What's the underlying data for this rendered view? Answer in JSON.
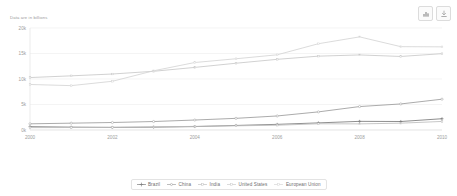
{
  "toolbar": {
    "buttons": [
      {
        "name": "chart-type-icon",
        "label": "Chart settings"
      },
      {
        "name": "download-icon",
        "label": "Download"
      }
    ]
  },
  "chart_data": {
    "type": "line",
    "title": "",
    "subtitle": "Data are in billions",
    "xlabel": "",
    "ylabel": "",
    "grid": true,
    "legend_position": "bottom",
    "x": [
      2000,
      2001,
      2002,
      2003,
      2004,
      2005,
      2006,
      2007,
      2008,
      2009,
      2010
    ],
    "xticks": [
      "2000",
      "2002",
      "2004",
      "2006",
      "2008",
      "2010"
    ],
    "yticks": [
      "0k",
      "5k",
      "10k",
      "15k",
      "20k"
    ],
    "ylim": [
      0,
      20000
    ],
    "xlim": [
      2000,
      2010
    ],
    "series": [
      {
        "name": "Brazil",
        "color": "#7a7a7a",
        "marker": "cross",
        "values": [
          655,
          560,
          510,
          558,
          670,
          892,
          1107,
          1397,
          1696,
          1667,
          2209
        ]
      },
      {
        "name": "China",
        "color": "#9c9c9c",
        "marker": "circle",
        "values": [
          1211,
          1339,
          1471,
          1660,
          1955,
          2286,
          2752,
          3552,
          4598,
          5110,
          6040
        ]
      },
      {
        "name": "India",
        "color": "#bdbdbd",
        "marker": "dot",
        "values": [
          468,
          485,
          515,
          608,
          709,
          820,
          940,
          1217,
          1199,
          1341,
          1676
        ]
      },
      {
        "name": "United States",
        "color": "#c9c9c9",
        "marker": "dot",
        "values": [
          10285,
          10622,
          10978,
          11511,
          12275,
          13094,
          13856,
          14478,
          14719,
          14419,
          14964
        ]
      },
      {
        "name": "European Union",
        "color": "#d5d5d5",
        "marker": "dot",
        "values": [
          8928,
          8699,
          9554,
          11610,
          13234,
          13971,
          14744,
          16918,
          18257,
          16340,
          16303
        ]
      }
    ]
  }
}
